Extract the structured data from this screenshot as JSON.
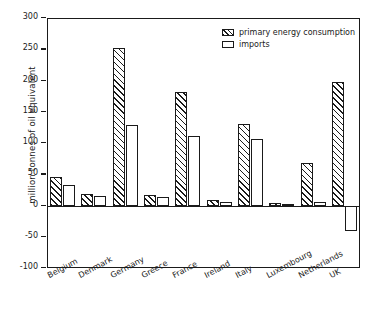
{
  "chart_data": {
    "type": "bar",
    "title": "",
    "xlabel": "",
    "ylabel": "million tonnes of oil equivalent",
    "ylim": [
      -100,
      300
    ],
    "yticks": [
      300,
      250,
      200,
      150,
      100,
      50,
      0,
      -50,
      -100
    ],
    "ytick_labels": [
      "300",
      "250",
      "200",
      "150",
      "100",
      "50",
      "0",
      "-50",
      "-100"
    ],
    "grid": false,
    "legend_position": "top-right",
    "categories": [
      "Belgium",
      "Denmark",
      "Germany",
      "Greece",
      "France",
      "Ireland",
      "Italy",
      "Luxembourg",
      "Netherlands",
      "UK"
    ],
    "series": [
      {
        "name": "primary energy consumption",
        "style": "hatched",
        "values": [
          45,
          19,
          252,
          17,
          181,
          9,
          131,
          4,
          68,
          198
        ]
      },
      {
        "name": "imports",
        "style": "open",
        "values": [
          33,
          15,
          129,
          13,
          112,
          5,
          107,
          3,
          5,
          -40
        ]
      }
    ]
  },
  "legend": {
    "items": [
      {
        "label": "primary energy consumption",
        "style": "hatched"
      },
      {
        "label": "imports",
        "style": "open"
      }
    ]
  },
  "colors": {
    "ink": "#1a1a1a",
    "background": "#ffffff"
  }
}
